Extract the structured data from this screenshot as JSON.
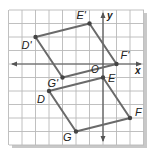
{
  "figure": {
    "type": "coordinate-plane-translation",
    "grid": {
      "x_min": -7,
      "x_max": 3,
      "y_min": -6,
      "y_max": 4,
      "unit_px": 13.5,
      "origin_px": [
        103,
        64
      ],
      "left_px": 9,
      "top_px": 10,
      "right_px": 144,
      "bottom_px": 145
    },
    "axes": {
      "x_label": "x",
      "y_label": "y",
      "origin_label": "O"
    },
    "colors": {
      "background": "#ffffff",
      "grid": "#b9b9b9",
      "axis": "#555555",
      "polygon": "#6a6a6a",
      "vertex": "#444444",
      "label": "#222222",
      "shadow": "#c8c8c8"
    },
    "original": {
      "name": "DEFG",
      "vertices": [
        {
          "label": "D",
          "x": -4,
          "y": -2,
          "label_dx": -12,
          "label_dy": 12
        },
        {
          "label": "E",
          "x": 0,
          "y": -1,
          "label_dx": 5,
          "label_dy": 4
        },
        {
          "label": "F",
          "x": 2,
          "y": -4,
          "label_dx": 5,
          "label_dy": -2
        },
        {
          "label": "G",
          "x": -2,
          "y": -5,
          "label_dx": -13,
          "label_dy": 9
        }
      ]
    },
    "image": {
      "name": "D'E'F'G'",
      "vertices": [
        {
          "label": "D'",
          "x": -5,
          "y": 2,
          "label_dx": -14,
          "label_dy": 12
        },
        {
          "label": "E'",
          "x": -1,
          "y": 3,
          "label_dx": -13,
          "label_dy": -5
        },
        {
          "label": "F'",
          "x": 1,
          "y": 0,
          "label_dx": 4,
          "label_dy": -5
        },
        {
          "label": "G'",
          "x": -3,
          "y": -1,
          "label_dx": -15,
          "label_dy": 9
        }
      ]
    }
  }
}
